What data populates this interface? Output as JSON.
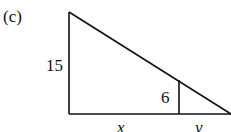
{
  "figure": {
    "label": "(c)",
    "side_left": "15",
    "side_inner": "6",
    "base_left": "x",
    "base_right": "y"
  }
}
